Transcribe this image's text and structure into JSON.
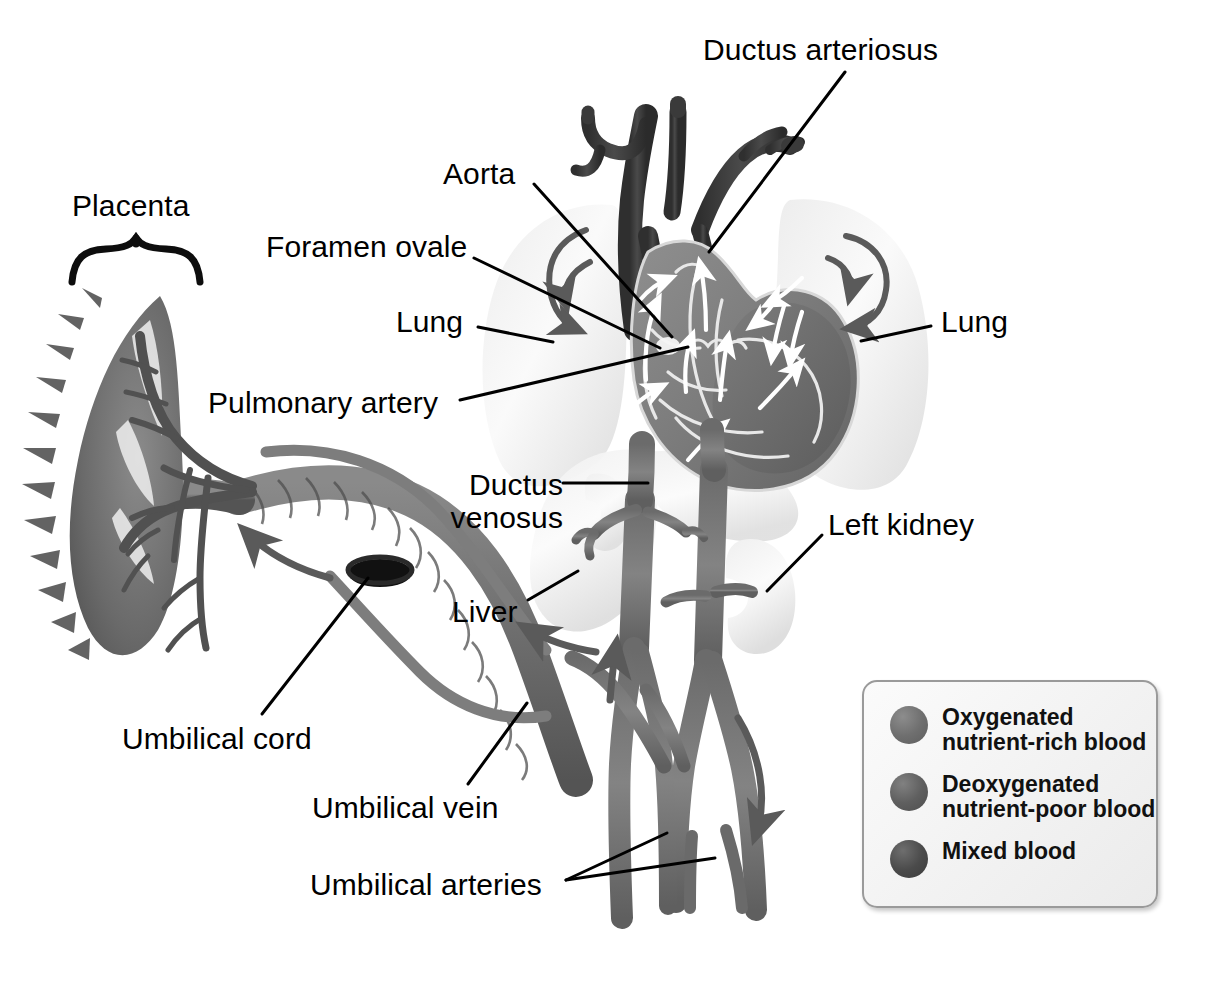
{
  "figure": {
    "kind": "fetal-circulation-anatomical-diagram",
    "background_color": "#ffffff",
    "ink_color": "#000000"
  },
  "labels": [
    {
      "id": "ductus-arteriosus",
      "text": "Ductus arteriosus",
      "x": 703,
      "y": 33,
      "align": "left"
    },
    {
      "id": "aorta",
      "text": "Aorta",
      "x": 443,
      "y": 157,
      "align": "left"
    },
    {
      "id": "placenta",
      "text": "Placenta",
      "x": 72,
      "y": 189,
      "align": "left"
    },
    {
      "id": "foramen-ovale",
      "text": "Foramen ovale",
      "x": 266,
      "y": 230,
      "align": "left"
    },
    {
      "id": "lung-left",
      "text": "Lung",
      "x": 396,
      "y": 305,
      "align": "left"
    },
    {
      "id": "lung-right",
      "text": "Lung",
      "x": 941,
      "y": 305,
      "align": "left"
    },
    {
      "id": "pulmonary-artery",
      "text": "Pulmonary artery",
      "x": 208,
      "y": 386,
      "align": "left"
    },
    {
      "id": "ductus-venosus",
      "text": "Ductus\nvenosus",
      "x": 424,
      "y": 468,
      "align": "left"
    },
    {
      "id": "left-kidney",
      "text": "Left kidney",
      "x": 828,
      "y": 508,
      "align": "left"
    },
    {
      "id": "liver",
      "text": "Liver",
      "x": 452,
      "y": 595,
      "align": "left"
    },
    {
      "id": "umbilical-cord",
      "text": "Umbilical cord",
      "x": 122,
      "y": 722,
      "align": "left"
    },
    {
      "id": "umbilical-vein",
      "text": "Umbilical vein",
      "x": 312,
      "y": 791,
      "align": "left"
    },
    {
      "id": "umbilical-arteries",
      "text": "Umbilical arteries",
      "x": 310,
      "y": 868,
      "align": "left"
    }
  ],
  "legend": {
    "title": "",
    "border_color": "#9a9a9a",
    "items": [
      {
        "id": "oxygenated",
        "swatch_color": "#6f6f6f",
        "text": "Oxygenated\nnutrient-rich blood"
      },
      {
        "id": "deoxygenated",
        "swatch_color": "#5f5f5f",
        "text": "Deoxygenated\nnutrient-poor blood"
      },
      {
        "id": "mixed",
        "swatch_color": "#4b4b4b",
        "text": "Mixed blood"
      }
    ]
  },
  "anatomy": {
    "placenta": {
      "tone": "#6c6c6c",
      "note": "villous disc on far left with branching chorionic vessels"
    },
    "umbilical_cord": {
      "tone": "#6d6d6d",
      "note": "twisted cord from placenta to fetal abdomen with dark clamp ring"
    },
    "clamp_ring": {
      "tone": "#141414"
    },
    "lungs": {
      "tone": "#e2e2e2",
      "count": 2
    },
    "liver": {
      "tone": "#e4e4e4"
    },
    "kidney": {
      "tone": "#e8e8e8",
      "count": 2
    },
    "heart": {
      "tone": "#7c7c7c",
      "note": "four-chambered heart with white interior flow arrows"
    },
    "great_vessels": {
      "tone": "#3f3f3f",
      "note": "aortic arch, brachiocephalic, carotid and subclavian branches"
    },
    "descending_aorta": {
      "tone": "#6f6f6f"
    },
    "ivc": {
      "tone": "#6f6f6f"
    },
    "flow_arrows": {
      "tone": "#5a5a5a",
      "note": "dark gray curved directional arrows outside vessels"
    },
    "internal_arrows": {
      "tone": "#ffffff",
      "note": "white arrows inside heart chambers showing blood path"
    }
  },
  "leader_lines": [
    {
      "from_label": "ductus-arteriosus",
      "x1": 845,
      "y1": 72,
      "x2": 709,
      "y2": 252
    },
    {
      "from_label": "aorta",
      "x1": 534,
      "y1": 184,
      "x2": 672,
      "y2": 337
    },
    {
      "from_label": "foramen-ovale",
      "x1": 474,
      "y1": 258,
      "x2": 660,
      "y2": 348
    },
    {
      "from_label": "lung-left",
      "x1": 478,
      "y1": 327,
      "x2": 553,
      "y2": 342
    },
    {
      "from_label": "lung-right",
      "x1": 931,
      "y1": 326,
      "x2": 861,
      "y2": 341
    },
    {
      "from_label": "pulmonary-artery",
      "x1": 460,
      "y1": 400,
      "x2": 688,
      "y2": 347
    },
    {
      "from_label": "ductus-venosus",
      "x1": 563,
      "y1": 483,
      "x2": 646,
      "y2": 483
    },
    {
      "from_label": "left-kidney",
      "x1": 822,
      "y1": 535,
      "x2": 767,
      "y2": 591
    },
    {
      "from_label": "liver",
      "x1": 528,
      "y1": 600,
      "x2": 578,
      "y2": 573
    },
    {
      "from_label": "umbilical-cord",
      "x1": 262,
      "y1": 714,
      "x2": 363,
      "y2": 578
    },
    {
      "from_label": "umbilical-vein",
      "x1": 468,
      "y1": 784,
      "x2": 526,
      "y2": 705
    },
    {
      "from_label": "umbilical-arteries-a",
      "x1": 566,
      "y1": 880,
      "x2": 667,
      "y2": 833
    },
    {
      "from_label": "umbilical-arteries-b",
      "x1": 566,
      "y1": 880,
      "x2": 713,
      "y2": 858
    }
  ],
  "placenta_brace": {
    "x_left": 70,
    "x_right": 204,
    "y_top": 243,
    "y_bottom": 282
  }
}
